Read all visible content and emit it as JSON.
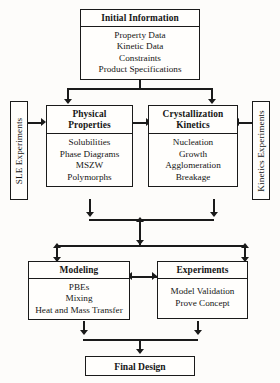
{
  "diagram": {
    "title_box": {
      "header": "Initial Information",
      "items": [
        "Property Data",
        "Kinetic Data",
        "Constraints",
        "Product Specifications"
      ]
    },
    "physical_properties": {
      "header": "Physical\nProperties",
      "header_line1": "Physical",
      "header_line2": "Properties",
      "items": [
        "Solubilities",
        "Phase Diagrams",
        "MSZW",
        "Polymorphs"
      ]
    },
    "crystallization_kinetics": {
      "header_line1": "Crystallization",
      "header_line2": "Kinetics",
      "items": [
        "Nucleation",
        "Growth",
        "Agglomeration",
        "Breakage"
      ]
    },
    "sle_experiments": {
      "label": "SLE Experiments"
    },
    "kinetics_experiments": {
      "label": "Kinetics Experiments"
    },
    "modeling": {
      "header": "Modeling",
      "items": [
        "PBEs",
        "Mixing",
        "Heat and Mass Transfer"
      ]
    },
    "experiments": {
      "header": "Experiments",
      "items": [
        "Model Validation",
        "Prove Concept"
      ]
    },
    "final_design": {
      "label": "Final Design"
    },
    "colors": {
      "stroke": "#1a1a1a",
      "box_fill": "#fffefc",
      "page_background": "#fdfcfa"
    }
  }
}
